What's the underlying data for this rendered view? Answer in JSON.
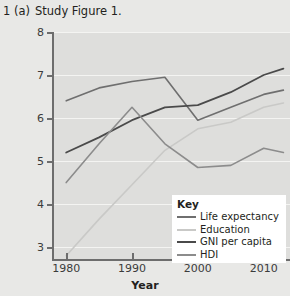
{
  "header": {
    "number": "1",
    "part": "(a)",
    "text": "Study Figure 1."
  },
  "chart_data": {
    "type": "line",
    "title": "",
    "xlabel": "Year",
    "ylabel": "",
    "x": [
      1980,
      1985,
      1990,
      1995,
      2000,
      2005,
      2010,
      2013
    ],
    "xlim": [
      1978,
      2014
    ],
    "ylim": [
      2.7,
      8
    ],
    "xticks": [
      1980,
      1990,
      2000,
      2010
    ],
    "xticklabels": [
      "1980",
      "1990",
      "2000",
      "2010"
    ],
    "yticks": [
      3,
      4,
      5,
      6,
      7,
      8
    ],
    "yticklabels": [
      "3",
      "4",
      "5",
      "6",
      "7",
      "8"
    ],
    "grid": "horizontal",
    "legend_position": "bottom-right",
    "legend_title": "Key",
    "series": [
      {
        "name": "Life expectancy",
        "color": "#6f6f6f",
        "width": 1.6,
        "values": [
          6.4,
          6.7,
          6.85,
          6.95,
          5.95,
          6.25,
          6.55,
          6.65
        ]
      },
      {
        "name": "Education",
        "color": "#c9c9c7",
        "width": 1.6,
        "values": [
          2.8,
          3.65,
          4.45,
          5.25,
          5.75,
          5.9,
          6.25,
          6.35
        ]
      },
      {
        "name": "GNI per capita",
        "color": "#4a4a4a",
        "width": 1.8,
        "values": [
          5.2,
          5.55,
          5.95,
          6.25,
          6.3,
          6.6,
          7.0,
          7.15
        ]
      },
      {
        "name": "HDI",
        "color": "#8c8c8c",
        "width": 1.6,
        "values": [
          4.5,
          5.4,
          6.25,
          5.4,
          4.85,
          4.9,
          5.3,
          5.2
        ]
      }
    ]
  },
  "colors": {
    "page_background": "#e8e8e6",
    "plot_background": "#dededc",
    "gridline": "#f4f4f2",
    "axis": "#6d6d6d",
    "legend_background": "#ffffff",
    "text": "#231f20"
  }
}
